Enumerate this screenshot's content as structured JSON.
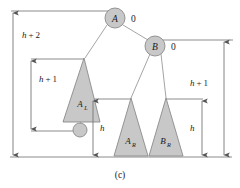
{
  "figure": {
    "caption": "(c)",
    "colors": {
      "node_fill": "#c8c8c8",
      "node_stroke": "#8a8a8a",
      "line": "#808080",
      "edge": "#9a9a9a",
      "text": "#1a1a1a",
      "background": "#ffffff"
    },
    "nodes": [
      {
        "id": "A",
        "label": "A",
        "balance": "0"
      },
      {
        "id": "B",
        "label": "B",
        "balance": "0"
      },
      {
        "id": "new",
        "label": "",
        "balance": ""
      }
    ],
    "subtrees": [
      {
        "id": "AL",
        "label": "A",
        "subscript": "L"
      },
      {
        "id": "AR",
        "label": "A",
        "subscript": "R"
      },
      {
        "id": "BR",
        "label": "B",
        "subscript": "R"
      }
    ],
    "measures": [
      {
        "id": "left-outer",
        "label_main": "h",
        "label_op": "+",
        "label_num": "2",
        "text": "h + 2"
      },
      {
        "id": "left-inner",
        "label_main": "h",
        "label_op": "+",
        "label_num": "1",
        "text": "h + 1"
      },
      {
        "id": "middle",
        "label_main": "h",
        "label_op": "",
        "label_num": "",
        "text": "h"
      },
      {
        "id": "right-inner",
        "label_main": "h",
        "label_op": "",
        "label_num": "",
        "text": "h"
      },
      {
        "id": "right-outer",
        "label_main": "h",
        "label_op": "+",
        "label_num": "1",
        "text": "h + 1"
      }
    ]
  }
}
